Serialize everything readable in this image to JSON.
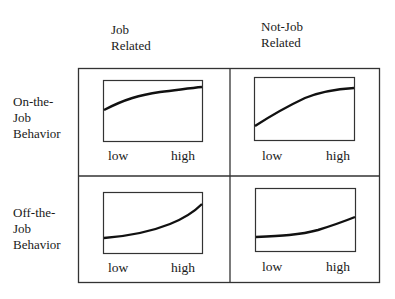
{
  "columns": [
    {
      "line1": "Job",
      "line2": "Related"
    },
    {
      "line1": "Not-Job",
      "line2": "Related"
    }
  ],
  "rows": [
    {
      "line1": "On-the-",
      "line2": "Job",
      "line3": "Behavior"
    },
    {
      "line1": "Off-the-",
      "line2": "Job",
      "line3": "Behavior"
    }
  ],
  "cells": [
    {
      "id": "on-job-related",
      "low_label": "low",
      "high_label": "high",
      "curve": "concave rising (steep start, flattening)"
    },
    {
      "id": "on-not-job-related",
      "low_label": "low",
      "high_label": "high",
      "curve": "steady rising, slightly concave"
    },
    {
      "id": "off-job-related",
      "low_label": "low",
      "high_label": "high",
      "curve": "convex rising (flat start, steep end)"
    },
    {
      "id": "off-not-job-related",
      "low_label": "low",
      "high_label": "high",
      "curve": "convex gently rising"
    }
  ],
  "colors": {
    "line": "#1a1a1a",
    "frame": "#333333",
    "background": "#ffffff"
  }
}
